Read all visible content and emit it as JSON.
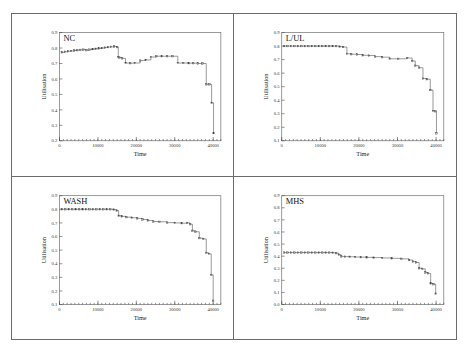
{
  "figure": {
    "axis_y_label": "Utilisation",
    "axis_x_label": "Time",
    "panel_count": 4
  },
  "chart_data": [
    {
      "type": "line",
      "title": "NC",
      "xlabel": "Time",
      "ylabel": "Utilisation",
      "xlim": [
        0,
        42000
      ],
      "ylim": [
        0.2,
        0.9
      ],
      "xticks": [
        0,
        10000,
        20000,
        30000,
        40000
      ],
      "xticklabels": [
        "0",
        "10000",
        "20000",
        "30000",
        "40000"
      ],
      "yticks": [
        0.2,
        0.3,
        0.4,
        0.5,
        0.6,
        0.7,
        0.8,
        0.9
      ],
      "yticklabels": [
        "0.2",
        "0.3",
        "0.4",
        "0.5",
        "0.6",
        "0.7",
        "0.8",
        "0.9"
      ],
      "grid": false,
      "legend": "none",
      "marker": "square-open",
      "step": true,
      "x": [
        600,
        1400,
        2200,
        3000,
        3800,
        4600,
        5400,
        6200,
        7000,
        7800,
        8600,
        9400,
        10200,
        11000,
        11800,
        12600,
        13400,
        14200,
        15000,
        15300,
        15600,
        16300,
        17200,
        18400,
        19600,
        21000,
        22400,
        23800,
        25200,
        26600,
        28000,
        29400,
        30800,
        32200,
        33600,
        34800,
        36000,
        37200,
        38200,
        39000,
        39600,
        40100
      ],
      "y": [
        0.772,
        0.776,
        0.779,
        0.781,
        0.784,
        0.786,
        0.788,
        0.79,
        0.786,
        0.79,
        0.793,
        0.795,
        0.798,
        0.8,
        0.803,
        0.806,
        0.808,
        0.81,
        0.806,
        0.742,
        0.738,
        0.733,
        0.703,
        0.702,
        0.703,
        0.719,
        0.723,
        0.742,
        0.747,
        0.747,
        0.747,
        0.747,
        0.703,
        0.703,
        0.702,
        0.702,
        0.7,
        0.7,
        0.565,
        0.565,
        0.445,
        0.25
      ]
    },
    {
      "type": "line",
      "title": "L/UL",
      "xlabel": "Time",
      "ylabel": "Utilisation",
      "xlim": [
        0,
        42000
      ],
      "ylim": [
        0.1,
        0.9
      ],
      "xticks": [
        0,
        10000,
        20000,
        30000,
        40000
      ],
      "xticklabels": [
        "0",
        "10000",
        "20000",
        "30000",
        "40000"
      ],
      "yticks": [
        0.1,
        0.2,
        0.3,
        0.4,
        0.5,
        0.6,
        0.7,
        0.8,
        0.9
      ],
      "yticklabels": [
        "0.1",
        "0.2",
        "0.3",
        "0.4",
        "0.5",
        "0.6",
        "0.7",
        "0.8",
        "0.9"
      ],
      "grid": false,
      "legend": "none",
      "marker": "square-open",
      "step": true,
      "x": [
        600,
        1500,
        2400,
        3300,
        4200,
        5100,
        6000,
        6900,
        7800,
        8700,
        9600,
        10500,
        11400,
        12300,
        13200,
        14100,
        15000,
        15900,
        16900,
        18000,
        19500,
        21000,
        22600,
        24200,
        26000,
        28000,
        30200,
        32500,
        33800,
        34600,
        35600,
        36600,
        37600,
        38500,
        39200,
        39800,
        40100
      ],
      "y": [
        0.8,
        0.8,
        0.8,
        0.8,
        0.8,
        0.8,
        0.8,
        0.8,
        0.8,
        0.8,
        0.8,
        0.8,
        0.8,
        0.8,
        0.8,
        0.8,
        0.796,
        0.793,
        0.743,
        0.74,
        0.738,
        0.732,
        0.73,
        0.722,
        0.718,
        0.706,
        0.706,
        0.712,
        0.69,
        0.655,
        0.64,
        0.56,
        0.555,
        0.475,
        0.32,
        0.318,
        0.155
      ]
    },
    {
      "type": "line",
      "title": "WASH",
      "xlabel": "Time",
      "ylabel": "Utilisation",
      "xlim": [
        0,
        42000
      ],
      "ylim": [
        0.1,
        0.9
      ],
      "xticks": [
        0,
        10000,
        20000,
        30000,
        40000
      ],
      "xticklabels": [
        "0",
        "10000",
        "20000",
        "30000",
        "40000"
      ],
      "yticks": [
        0.1,
        0.2,
        0.3,
        0.4,
        0.5,
        0.6,
        0.7,
        0.8,
        0.9
      ],
      "yticklabels": [
        "0.1",
        "0.2",
        "0.3",
        "0.4",
        "0.5",
        "0.6",
        "0.7",
        "0.8",
        "0.9"
      ],
      "grid": false,
      "legend": "none",
      "marker": "square-open",
      "step": true,
      "x": [
        600,
        1500,
        2400,
        3300,
        4200,
        5100,
        6000,
        6900,
        7800,
        8700,
        9600,
        10500,
        11400,
        12300,
        13200,
        14100,
        14900,
        15400,
        16200,
        17400,
        18800,
        20200,
        21600,
        23000,
        24400,
        26000,
        28000,
        30000,
        31800,
        33200,
        34000,
        34600,
        35400,
        36400,
        37400,
        38200,
        38900,
        39500,
        40000
      ],
      "y": [
        0.8,
        0.8,
        0.8,
        0.8,
        0.8,
        0.8,
        0.8,
        0.8,
        0.8,
        0.8,
        0.8,
        0.8,
        0.8,
        0.8,
        0.8,
        0.798,
        0.79,
        0.752,
        0.748,
        0.742,
        0.738,
        0.733,
        0.725,
        0.718,
        0.71,
        0.708,
        0.702,
        0.7,
        0.698,
        0.7,
        0.69,
        0.642,
        0.635,
        0.588,
        0.582,
        0.48,
        0.472,
        0.318,
        0.128
      ]
    },
    {
      "type": "line",
      "title": "MHS",
      "xlabel": "Time",
      "ylabel": "Utilisation",
      "xlim": [
        0,
        42000
      ],
      "ylim": [
        0.0,
        0.9
      ],
      "xticks": [
        0,
        10000,
        20000,
        30000,
        40000
      ],
      "xticklabels": [
        "0",
        "10000",
        "20000",
        "30000",
        "40000"
      ],
      "yticks": [
        0.0,
        0.1,
        0.2,
        0.3,
        0.4,
        0.5,
        0.6,
        0.7,
        0.8,
        0.9
      ],
      "yticklabels": [
        "0.0",
        "0.1",
        "0.2",
        "0.3",
        "0.4",
        "0.5",
        "0.6",
        "0.7",
        "0.8",
        "0.9"
      ],
      "grid": false,
      "legend": "none",
      "marker": "square-open",
      "step": true,
      "x": [
        600,
        1500,
        2400,
        3300,
        4200,
        5100,
        6000,
        6900,
        7800,
        8700,
        9600,
        10500,
        11400,
        12300,
        13200,
        14100,
        14800,
        15400,
        16400,
        17600,
        19000,
        20500,
        22000,
        23800,
        26000,
        28500,
        31000,
        33000,
        34000,
        34800,
        35600,
        36400,
        37200,
        37900,
        38600,
        39300,
        39900
      ],
      "y": [
        0.43,
        0.43,
        0.43,
        0.43,
        0.43,
        0.43,
        0.43,
        0.43,
        0.43,
        0.43,
        0.43,
        0.43,
        0.43,
        0.43,
        0.428,
        0.425,
        0.412,
        0.398,
        0.396,
        0.395,
        0.393,
        0.392,
        0.39,
        0.388,
        0.385,
        0.382,
        0.378,
        0.368,
        0.355,
        0.348,
        0.3,
        0.295,
        0.265,
        0.258,
        0.175,
        0.168,
        0.09
      ]
    }
  ]
}
